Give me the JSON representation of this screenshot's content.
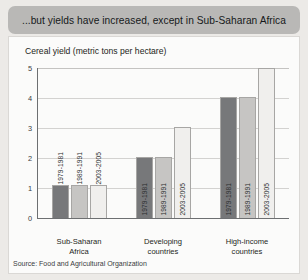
{
  "banner": {
    "text": "...but yields have increased, except in Sub-Saharan Africa"
  },
  "card": {
    "chart_title": "Cereal yield (metric tons per hectare)",
    "source": "Source: Food and Agricultural Organization"
  },
  "chart_data": {
    "type": "bar",
    "title": "Cereal yield (metric tons per hectare)",
    "xlabel": "",
    "ylabel": "",
    "ylim": [
      0,
      5
    ],
    "yticks": [
      "0",
      "1",
      "2",
      "3",
      "4",
      "5"
    ],
    "grid": true,
    "legend": "none",
    "categories": [
      "Sub-Saharan Africa",
      "Developing countries",
      "High-income countries"
    ],
    "category_lines": [
      [
        "Sub-Saharan",
        "Africa"
      ],
      [
        "Developing",
        "countries"
      ],
      [
        "High-income",
        "countries"
      ]
    ],
    "series": [
      {
        "name": "1979-1981",
        "color": "#77787a",
        "values": [
          1.1,
          2.05,
          4.05
        ]
      },
      {
        "name": "1989-1991",
        "color": "#c6c5c3",
        "values": [
          1.1,
          2.05,
          4.05
        ]
      },
      {
        "name": "2003-2005",
        "color": "#f0efed",
        "values": [
          1.1,
          3.05,
          5.0
        ]
      }
    ],
    "source": "Food and Agricultural Organization"
  }
}
